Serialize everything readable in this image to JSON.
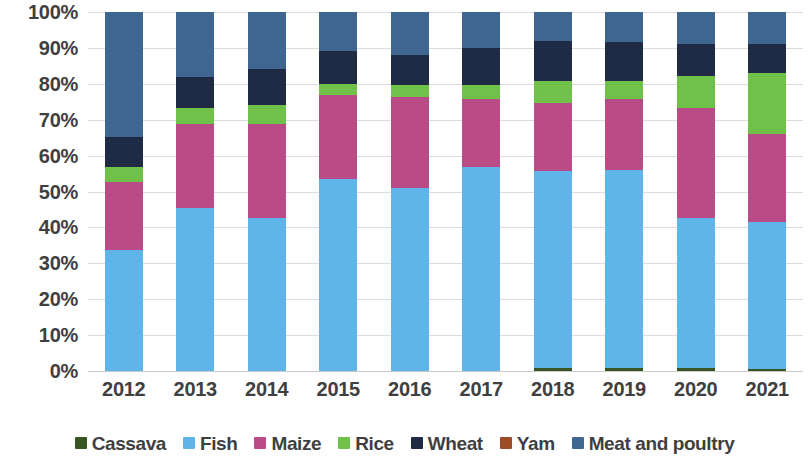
{
  "chart_data": {
    "type": "bar",
    "subtype": "stacked-100-percent",
    "title": "",
    "subtitle": "",
    "xlabel": "",
    "ylabel": "",
    "grid": true,
    "legend_position": "bottom",
    "ylim": [
      0,
      100
    ],
    "y_tick_labels": [
      "0%",
      "10%",
      "20%",
      "30%",
      "40%",
      "50%",
      "60%",
      "70%",
      "80%",
      "90%",
      "100%"
    ],
    "y_ticks": [
      0,
      10,
      20,
      30,
      40,
      50,
      60,
      70,
      80,
      90,
      100
    ],
    "categories": [
      "2012",
      "2013",
      "2014",
      "2015",
      "2016",
      "2017",
      "2018",
      "2019",
      "2020",
      "2021"
    ],
    "series": [
      {
        "name": "Cassava",
        "color": "#375623",
        "values": [
          0,
          0,
          0,
          0,
          0,
          0,
          0.8,
          0.7,
          0.7,
          0.6
        ]
      },
      {
        "name": "Fish",
        "color": "#5fb5ea",
        "values": [
          33.6,
          45.3,
          42.6,
          53.5,
          51.0,
          56.7,
          54.8,
          55.3,
          42.0,
          40.8
        ]
      },
      {
        "name": "Maize",
        "color": "#b94b87",
        "values": [
          19.0,
          23.5,
          26.2,
          23.5,
          25.3,
          19.0,
          19.0,
          19.7,
          30.5,
          24.7
        ]
      },
      {
        "name": "Rice",
        "color": "#70c14a",
        "values": [
          4.2,
          4.5,
          5.2,
          3.0,
          3.5,
          4.0,
          6.2,
          5.0,
          9.0,
          16.9
        ]
      },
      {
        "name": "Wheat",
        "color": "#1f2b44",
        "values": [
          8.4,
          8.7,
          10.0,
          9.0,
          8.2,
          10.3,
          11.0,
          11.0,
          8.8,
          8.2
        ]
      },
      {
        "name": "Yam",
        "color": "#9c4d26",
        "values": [
          0,
          0,
          0,
          0,
          0,
          0,
          0,
          0,
          0,
          0
        ]
      },
      {
        "name": "Meat and poultry",
        "color": "#3f6691",
        "values": [
          34.8,
          18.0,
          16.0,
          11.0,
          12.0,
          10.0,
          8.2,
          8.3,
          9.0,
          8.8
        ]
      }
    ]
  },
  "legend": {
    "items": [
      {
        "label": "Cassava",
        "color": "#375623"
      },
      {
        "label": "Fish",
        "color": "#5fb5ea"
      },
      {
        "label": "Maize",
        "color": "#b94b87"
      },
      {
        "label": "Rice",
        "color": "#70c14a"
      },
      {
        "label": "Wheat",
        "color": "#1f2b44"
      },
      {
        "label": "Yam",
        "color": "#9c4d26"
      },
      {
        "label": "Meat and poultry",
        "color": "#3f6691"
      }
    ]
  }
}
